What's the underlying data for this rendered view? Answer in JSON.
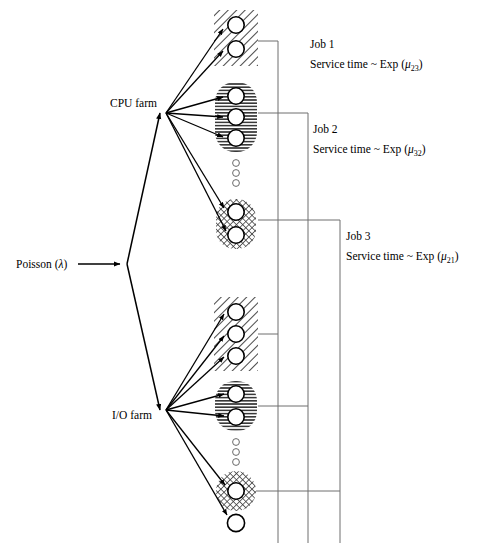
{
  "diagram": {
    "source_label": {
      "text": "Poisson (λ)",
      "prefix": "Poisson (",
      "symbol": "λ",
      "suffix": ")"
    },
    "farms": [
      {
        "id": "cpu-farm",
        "label": "CPU farm"
      },
      {
        "id": "io-farm",
        "label": "I/O farm"
      }
    ],
    "jobs": [
      {
        "id": "job-1",
        "title": "Job 1",
        "service_prefix": "Service time ~ Exp (",
        "service_symbol": "μ",
        "service_subscript": "23",
        "service_suffix": ")",
        "service_text": "Service time ~ Exp (μ23)",
        "pattern": "diagonal-hatch"
      },
      {
        "id": "job-2",
        "title": "Job 2",
        "service_prefix": "Service time ~ Exp (",
        "service_symbol": "μ",
        "service_subscript": "32",
        "service_suffix": ")",
        "service_text": "Service time ~ Exp (μ32)",
        "pattern": "horizontal-lines"
      },
      {
        "id": "job-3",
        "title": "Job 3",
        "service_prefix": "Service time ~ Exp (",
        "service_symbol": "μ",
        "service_subscript": "21",
        "service_suffix": ")",
        "service_text": "Service time ~ Exp (μ21)",
        "pattern": "cross-hatch"
      }
    ],
    "clusters": [
      {
        "id": "cpu-cluster-job1",
        "farm": "cpu-farm",
        "job": "job-1",
        "pattern": "diagonal-hatch",
        "server_count": 2
      },
      {
        "id": "cpu-cluster-job2",
        "farm": "cpu-farm",
        "job": "job-2",
        "pattern": "horizontal-lines",
        "server_count": 3
      },
      {
        "id": "cpu-cluster-job3",
        "farm": "cpu-farm",
        "job": "job-3",
        "pattern": "cross-hatch",
        "server_count": 2
      },
      {
        "id": "io-cluster-job1",
        "farm": "io-farm",
        "job": "job-1",
        "pattern": "diagonal-hatch",
        "server_count": 3
      },
      {
        "id": "io-cluster-job2",
        "farm": "io-farm",
        "job": "job-2",
        "pattern": "horizontal-lines",
        "server_count": 2
      },
      {
        "id": "io-cluster-job3",
        "farm": "io-farm",
        "job": "job-3",
        "pattern": "cross-hatch",
        "server_count": 1
      }
    ],
    "ellipsis_groups": [
      {
        "id": "cpu-ellipsis",
        "dot_count": 3
      },
      {
        "id": "io-ellipsis",
        "dot_count": 3
      }
    ],
    "extra_nodes": [
      {
        "id": "io-tail-server",
        "pattern": "none"
      }
    ],
    "colors": {
      "ink": "#000000",
      "connector": "#6e6e6e",
      "background": "#ffffff",
      "pattern_fill": "#8a8a8a"
    }
  }
}
